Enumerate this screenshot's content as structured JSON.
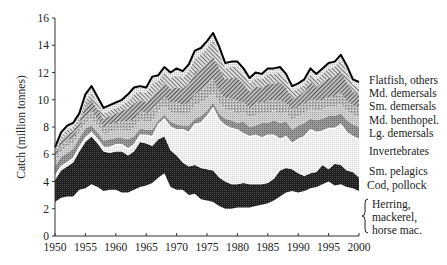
{
  "chart_data": {
    "type": "area",
    "stacked": true,
    "title": "",
    "xlabel": "",
    "ylabel": "Catch (million tonnes)",
    "xlim": [
      1950,
      2000
    ],
    "ylim": [
      0,
      16
    ],
    "x_ticks": [
      1950,
      1955,
      1960,
      1965,
      1970,
      1975,
      1980,
      1985,
      1990,
      1995,
      2000
    ],
    "y_ticks": [
      0,
      2,
      4,
      6,
      8,
      10,
      12,
      14,
      16
    ],
    "grid": false,
    "legend_position": "right, labels aligned to layers",
    "x": [
      1950,
      1951,
      1952,
      1953,
      1954,
      1955,
      1956,
      1957,
      1958,
      1959,
      1960,
      1961,
      1962,
      1963,
      1964,
      1965,
      1966,
      1967,
      1968,
      1969,
      1970,
      1971,
      1972,
      1973,
      1974,
      1975,
      1976,
      1977,
      1978,
      1979,
      1980,
      1981,
      1982,
      1983,
      1984,
      1985,
      1986,
      1987,
      1988,
      1989,
      1990,
      1991,
      1992,
      1993,
      1994,
      1995,
      1996,
      1997,
      1998,
      1999,
      2000
    ],
    "cumulative_boundaries": {
      "herring_top": [
        2.5,
        2.8,
        2.9,
        2.9,
        3.4,
        3.5,
        3.8,
        3.6,
        3.3,
        3.4,
        3.4,
        3.2,
        3.2,
        3.4,
        3.6,
        3.7,
        3.9,
        4.3,
        4.6,
        3.6,
        3.4,
        3.4,
        3.0,
        3.1,
        2.7,
        2.6,
        2.5,
        2.2,
        2.0,
        2.0,
        2.1,
        2.1,
        2.1,
        2.2,
        2.3,
        2.4,
        2.6,
        2.9,
        3.2,
        3.3,
        3.2,
        3.3,
        3.5,
        3.6,
        3.8,
        4.0,
        3.7,
        3.8,
        3.6,
        3.5,
        3.3
      ],
      "cod_top": [
        4.1,
        4.8,
        5.1,
        5.4,
        6.2,
        6.9,
        7.3,
        6.8,
        6.2,
        6.1,
        6.2,
        6.2,
        5.9,
        6.2,
        6.9,
        6.8,
        6.6,
        7.1,
        7.3,
        6.3,
        5.9,
        5.4,
        5.1,
        5.2,
        5.0,
        4.9,
        4.8,
        4.3,
        4.0,
        3.8,
        3.8,
        3.9,
        3.8,
        3.8,
        3.8,
        3.9,
        4.2,
        4.8,
        5.0,
        4.9,
        4.6,
        4.4,
        4.6,
        4.7,
        5.2,
        4.9,
        5.3,
        5.2,
        4.8,
        4.7,
        4.3
      ],
      "sm_pelagics_top": [
        4.4,
        5.1,
        5.4,
        5.7,
        6.5,
        7.2,
        7.6,
        7.1,
        6.5,
        6.5,
        6.7,
        6.7,
        6.4,
        6.7,
        7.4,
        7.4,
        7.3,
        8.2,
        8.6,
        8.0,
        7.8,
        7.8,
        7.6,
        8.2,
        8.3,
        8.8,
        9.4,
        8.5,
        8.1,
        7.9,
        7.8,
        7.5,
        7.3,
        7.4,
        7.2,
        7.4,
        7.4,
        7.1,
        7.3,
        6.8,
        7.1,
        7.3,
        7.8,
        7.6,
        7.7,
        7.9,
        7.9,
        8.2,
        7.6,
        7.3,
        7.1
      ],
      "invertebrates_top": [
        5.1,
        5.8,
        6.1,
        6.4,
        7.2,
        7.9,
        8.1,
        7.6,
        7.0,
        7.1,
        7.2,
        7.2,
        7.1,
        7.3,
        7.9,
        7.8,
        7.8,
        8.5,
        8.9,
        8.4,
        8.2,
        8.1,
        8.1,
        8.6,
        8.8,
        9.2,
        9.8,
        9.0,
        8.6,
        8.5,
        8.3,
        8.4,
        8.0,
        8.1,
        8.3,
        8.3,
        8.5,
        8.3,
        8.4,
        7.8,
        8.1,
        8.3,
        8.6,
        8.5,
        8.6,
        8.8,
        8.8,
        9.0,
        8.5,
        8.2,
        8.0
      ],
      "lg_demersals_top": [
        5.5,
        6.2,
        6.6,
        6.8,
        7.6,
        8.3,
        8.6,
        8.1,
        7.5,
        7.6,
        7.8,
        7.8,
        7.7,
        7.9,
        8.5,
        8.4,
        8.4,
        9.2,
        9.6,
        9.1,
        9.0,
        8.9,
        9.0,
        9.6,
        9.8,
        10.1,
        10.5,
        9.8,
        9.3,
        9.2,
        9.0,
        9.1,
        8.7,
        8.9,
        9.0,
        9.0,
        9.2,
        9.0,
        9.1,
        8.5,
        8.8,
        9.0,
        9.4,
        9.2,
        9.3,
        9.5,
        9.5,
        9.7,
        9.2,
        8.9,
        8.7
      ],
      "md_benthopel_top": [
        5.8,
        6.6,
        7.0,
        7.2,
        8.0,
        8.8,
        9.2,
        8.6,
        8.0,
        8.2,
        8.3,
        8.4,
        8.4,
        8.6,
        9.2,
        9.0,
        9.2,
        9.8,
        10.2,
        9.8,
        9.8,
        9.6,
        9.8,
        10.4,
        10.7,
        11.0,
        11.5,
        10.6,
        10.1,
        10.1,
        9.9,
        9.8,
        9.4,
        9.7,
        9.8,
        9.9,
        10.0,
        9.9,
        9.8,
        9.2,
        9.5,
        9.7,
        10.1,
        9.9,
        10.0,
        10.2,
        10.3,
        10.5,
        9.9,
        9.6,
        9.4
      ],
      "sm_demersals_top": [
        6.1,
        7.0,
        7.5,
        7.7,
        8.4,
        9.5,
        10.0,
        9.3,
        8.6,
        8.8,
        9.0,
        9.2,
        9.4,
        9.7,
        10.0,
        9.8,
        10.3,
        10.7,
        11.2,
        10.8,
        10.9,
        10.8,
        11.2,
        12.0,
        12.3,
        12.7,
        13.2,
        12.3,
        11.5,
        11.6,
        11.6,
        11.2,
        10.6,
        11.0,
        10.9,
        11.2,
        11.2,
        11.3,
        10.9,
        10.1,
        10.3,
        10.6,
        11.3,
        10.9,
        11.3,
        11.6,
        11.7,
        12.1,
        11.3,
        10.6,
        10.4
      ],
      "md_demersals_top": [
        6.3,
        7.3,
        7.8,
        8.0,
        8.7,
        9.9,
        10.5,
        9.8,
        9.0,
        9.2,
        9.4,
        9.6,
        9.9,
        10.4,
        10.6,
        10.5,
        11.2,
        11.4,
        12.0,
        11.6,
        11.8,
        11.6,
        12.1,
        13.0,
        13.3,
        13.8,
        14.4,
        13.4,
        12.3,
        12.4,
        12.4,
        11.9,
        11.2,
        11.6,
        11.5,
        11.9,
        11.9,
        12.0,
        11.5,
        10.6,
        10.8,
        11.1,
        11.9,
        11.5,
        11.9,
        12.3,
        12.4,
        12.9,
        12.1,
        11.1,
        10.9
      ],
      "total": [
        6.5,
        7.6,
        8.1,
        8.3,
        9.0,
        10.4,
        11.0,
        10.2,
        9.4,
        9.6,
        9.8,
        10.0,
        10.4,
        10.9,
        11.0,
        10.9,
        11.7,
        11.8,
        12.4,
        12.0,
        12.3,
        12.1,
        12.6,
        13.6,
        13.8,
        14.3,
        14.9,
        13.9,
        12.7,
        12.8,
        12.8,
        12.3,
        11.6,
        12.0,
        11.9,
        12.3,
        12.3,
        12.4,
        11.9,
        11.0,
        11.2,
        11.5,
        12.3,
        11.9,
        12.3,
        12.7,
        12.8,
        13.3,
        12.5,
        11.5,
        11.3
      ]
    },
    "series": [
      {
        "name": "Herring, mackerel, horse mac.",
        "fill": "#ffffff"
      },
      {
        "name": "Cod, pollock",
        "fill": "#2b2b2b"
      },
      {
        "name": "Sm. pelagics",
        "fill": "#ececec"
      },
      {
        "name": "Invertebrates",
        "fill": "#8a8a8a"
      },
      {
        "name": "Lg. demersals",
        "fill": "#c4c4c4"
      },
      {
        "name": "Md. benthopel.",
        "fill": "#a8a8a8"
      },
      {
        "name": "Sm. demersals",
        "fill": "#7a7a7a"
      },
      {
        "name": "Md. demersals",
        "fill": "#b8b8b8"
      },
      {
        "name": "Flatfish, others",
        "fill": "#d6d6d6"
      }
    ]
  },
  "axes": {
    "ylabel": "Catch (million tonnes)",
    "x_tick_labels": [
      "1950",
      "1955",
      "1960",
      "1965",
      "1970",
      "1975",
      "1980",
      "1985",
      "1990",
      "1995",
      "2000"
    ],
    "y_tick_labels": [
      "0",
      "2",
      "4",
      "6",
      "8",
      "10",
      "12",
      "14",
      "16"
    ]
  },
  "legend": {
    "flatfish": "Flatfish, others",
    "md_demersals": "Md. demersals",
    "sm_demersals": "Sm. demersals",
    "md_benthopel": "Md. benthopel.",
    "lg_demersals": "Lg. demersals",
    "invertebrates": "Invertebrates",
    "sm_pelagics": "Sm. pelagics",
    "cod": "Cod, pollock",
    "herring_lines": [
      "Herring,",
      "mackerel,",
      "horse mac."
    ]
  }
}
